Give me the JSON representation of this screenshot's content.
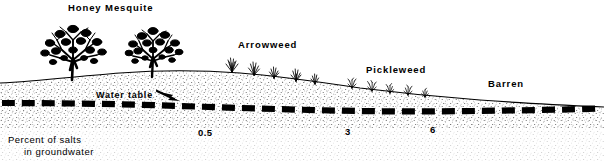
{
  "figure": {
    "zone_labels": [
      {
        "text": "Honey Mesquite",
        "x": 68,
        "y": 2
      },
      {
        "text": "Arrowweed",
        "x": 238,
        "y": 39
      },
      {
        "text": "Pickleweed",
        "x": 366,
        "y": 64
      },
      {
        "text": "Barren",
        "x": 488,
        "y": 78
      }
    ],
    "water_table_label": {
      "text": "Water table",
      "x": 96,
      "y": 96
    },
    "tick_labels": [
      {
        "text": "0.5",
        "x": 198,
        "y": 127
      },
      {
        "text": "3",
        "x": 345,
        "y": 126
      },
      {
        "text": "6",
        "x": 430,
        "y": 124
      }
    ],
    "caption": {
      "line1": "Percent of salts",
      "line2": "in groundwater"
    },
    "colors": {
      "ink": "#000000",
      "background": "#ffffff"
    }
  }
}
